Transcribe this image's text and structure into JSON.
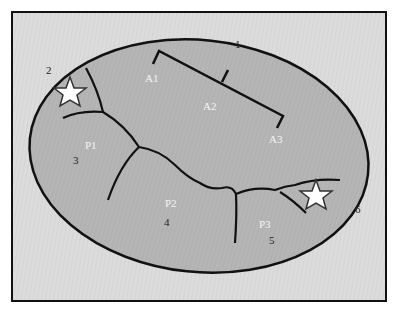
{
  "diagram": {
    "type": "watershed-schematic",
    "colors": {
      "background": "#dcdcdc",
      "frame": "#111111",
      "basin_fill": "#b4b4b4",
      "lines": "#111111",
      "star_fill": "#ffffff",
      "star_stroke": "#333333",
      "zone_label": "#f4f4f4",
      "number_label": "#222222"
    },
    "zone_labels": {
      "a1": "A1",
      "a2": "A2",
      "a3": "A3",
      "p1": "P1",
      "p2": "P2",
      "p3": "P3"
    },
    "number_labels": {
      "n1": "1",
      "n2": "2",
      "n3": "3",
      "n4": "4",
      "n5": "5",
      "n6": "6"
    },
    "markers": [
      {
        "name": "star-upper-left",
        "symbol": "star"
      },
      {
        "name": "star-lower-right",
        "symbol": "star"
      }
    ]
  }
}
